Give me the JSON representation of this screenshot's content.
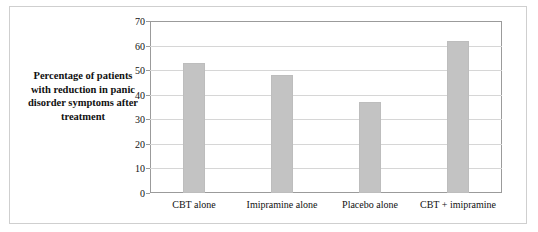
{
  "chart_data": {
    "type": "bar",
    "title": "",
    "xlabel": "",
    "ylabel": "Percentage of patients with reduction in panic disorder symptoms after treatment",
    "categories": [
      "CBT alone",
      "Imipramine alone",
      "Placebo alone",
      "CBT + imipramine"
    ],
    "values": [
      53,
      48,
      37,
      62
    ],
    "ylim": [
      0,
      70
    ],
    "yticks": [
      0,
      10,
      20,
      30,
      40,
      50,
      60,
      70
    ],
    "ytick_labels": [
      "0",
      "10",
      "20",
      "30",
      "40",
      "50",
      "60",
      "70"
    ],
    "grid": true,
    "legend": null,
    "bar_color": "#c3c3c3",
    "axis_color": "#9b9b9b",
    "frame_color": "#cfcfcf"
  }
}
